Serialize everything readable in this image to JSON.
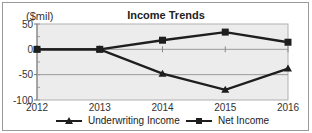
{
  "chart_data": {
    "type": "line",
    "title": "Income Trends",
    "ylabel": "($mil)",
    "xlabel": "",
    "x": [
      "2012",
      "2013",
      "2014",
      "2015",
      "2016"
    ],
    "series": [
      {
        "name": "Underwriting Income",
        "marker": "triangle",
        "values": [
          0,
          0,
          -48,
          -80,
          -38
        ]
      },
      {
        "name": "Net Income",
        "marker": "square",
        "values": [
          0,
          0,
          18,
          34,
          14
        ]
      }
    ],
    "ylim": [
      -100,
      50
    ],
    "yticks": [
      "50",
      "0",
      "-50",
      "-100"
    ],
    "grid": true,
    "legend_position": "bottom"
  },
  "colors": {
    "plot_bg": "#ececec",
    "line": "#1e1e1e",
    "grid": "#9a9a9a"
  }
}
